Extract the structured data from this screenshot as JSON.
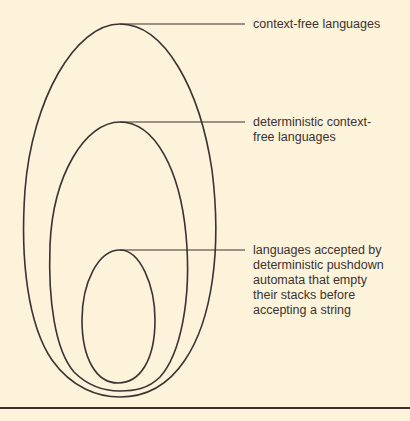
{
  "diagram": {
    "type": "nested-sets",
    "colors": {
      "background": "#fdf2da",
      "stroke": "#3a3330"
    },
    "sets": [
      {
        "id": "cfl",
        "label": "context-free languages",
        "label_lines": [
          "context-free languages"
        ],
        "contains": [
          "dcfl"
        ]
      },
      {
        "id": "dcfl",
        "label": "deterministic context-free languages",
        "label_lines": [
          "deterministic context-",
          "free languages"
        ],
        "contains": [
          "dpda-empty-stack"
        ]
      },
      {
        "id": "dpda-empty-stack",
        "label": "languages accepted by deterministic pushdown automata that empty their stacks before accepting a string",
        "label_lines": [
          "languages accepted by",
          "deterministic pushdown",
          "automata that empty",
          "their stacks before",
          "accepting a string"
        ],
        "contains": []
      }
    ],
    "caption_partial": "2.30  Classification of context-free languages (cut off)"
  }
}
